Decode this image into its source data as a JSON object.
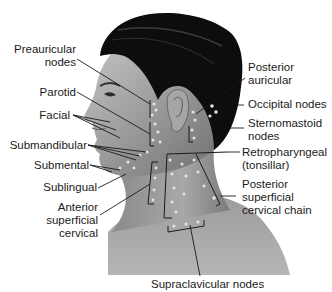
{
  "figure": {
    "labels_left": [
      {
        "id": "preauricular",
        "text": "Preauricular\nnodes"
      },
      {
        "id": "parotid",
        "text": "Parotid"
      },
      {
        "id": "facial",
        "text": "Facial"
      },
      {
        "id": "submandibular",
        "text": "Submandibular"
      },
      {
        "id": "submental",
        "text": "Submental"
      },
      {
        "id": "sublingual",
        "text": "Sublingual"
      },
      {
        "id": "anterior-superficial-cervical",
        "text": "Anterior\nsuperficial\ncervical"
      }
    ],
    "labels_right": [
      {
        "id": "posterior-auricular",
        "text": "Posterior\nauricular"
      },
      {
        "id": "occipital",
        "text": "Occipital nodes"
      },
      {
        "id": "sternomastoid",
        "text": "Sternomastoid\nnodes"
      },
      {
        "id": "retropharyngeal",
        "text": "Retropharyngeal\n(tonsillar)"
      },
      {
        "id": "posterior-superficial-cervical",
        "text": "Posterior\nsuperficial\ncervical chain"
      }
    ],
    "labels_bottom": [
      {
        "id": "supraclavicular",
        "text": "Supraclavicular nodes"
      }
    ],
    "colors": {
      "background": "#ffffff",
      "skin": "#8e8e8e",
      "skin_light": "#b8b8b8",
      "hair": "#0d0d0d",
      "leader_line": "#1a1a1a",
      "node": "#dedede",
      "text": "#1a1a1a"
    }
  }
}
